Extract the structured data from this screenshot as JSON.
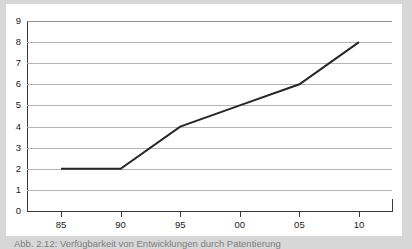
{
  "figure": {
    "caption": "Abb. 2.12: Verfügbarkeit von Entwicklungen durch Patentierung",
    "background_color": "#d7d7d7",
    "card_color": "#ffffff"
  },
  "chart_data": {
    "type": "line",
    "title": "",
    "subtitle": "",
    "xlabel": "",
    "ylabel": "",
    "x": [
      "85",
      "90",
      "95",
      "00",
      "05",
      "10"
    ],
    "categories": [
      "85",
      "90",
      "95",
      "00",
      "05",
      "10"
    ],
    "values": [
      2,
      2,
      4,
      5,
      6,
      8
    ],
    "series": [
      {
        "name": "",
        "values": [
          2,
          2,
          4,
          5,
          6,
          8
        ],
        "color": "#262626",
        "line_width": 2
      }
    ],
    "xlim": [
      1983,
      2012
    ],
    "ylim": [
      0,
      9
    ],
    "ytick_labels": [
      "0",
      "1",
      "2",
      "3",
      "4",
      "5",
      "6",
      "7",
      "8",
      "9"
    ],
    "ytick_values": [
      0,
      1,
      2,
      3,
      4,
      5,
      6,
      7,
      8,
      9
    ],
    "xtick_labels": [
      "85",
      "90",
      "95",
      "00",
      "05",
      "10"
    ],
    "grid": "horizontal",
    "grid_color": "#b5b5b5",
    "axis_color": "#3a3a3a",
    "legend": "none",
    "legend_position": "none",
    "annotations": []
  }
}
